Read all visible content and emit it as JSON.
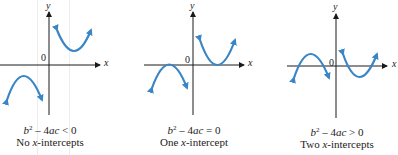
{
  "figure": {
    "curve_color": "#3a85c6",
    "axis_color": "#1a1a1a",
    "panels": [
      {
        "id": "no-intercepts",
        "axis_x_label": "x",
        "axis_y_label": "y",
        "origin_label": "0",
        "formula_lhs": "b",
        "formula_exp": "2",
        "formula_rest_pre": " – 4",
        "formula_ac": "ac",
        "formula_rel": " < 0",
        "desc_pre": "No ",
        "desc_var": "x",
        "desc_post": "-intercepts"
      },
      {
        "id": "one-intercept",
        "axis_x_label": "x",
        "axis_y_label": "y",
        "origin_label": "0",
        "formula_lhs": "b",
        "formula_exp": "2",
        "formula_rest_pre": " – 4",
        "formula_ac": "ac",
        "formula_rel": " = 0",
        "desc_pre": "One ",
        "desc_var": "x",
        "desc_post": "-intercept"
      },
      {
        "id": "two-intercepts",
        "axis_x_label": "x",
        "axis_y_label": "y",
        "origin_label": "0",
        "formula_lhs": "b",
        "formula_exp": "2",
        "formula_rest_pre": " – 4",
        "formula_ac": "ac",
        "formula_rel": " > 0",
        "desc_pre": "Two ",
        "desc_var": "x",
        "desc_post": "-intercepts"
      }
    ]
  }
}
